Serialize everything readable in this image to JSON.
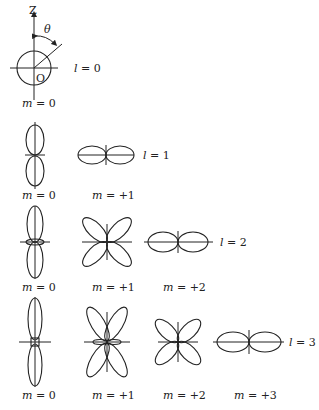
{
  "diagram": {
    "axis_label": "Z",
    "angle_label": "θ",
    "origin_label": "O",
    "rows": [
      {
        "l_label": "l = 0",
        "l_var": "l",
        "l_eq": " = 0",
        "items": [
          {
            "m_var": "m",
            "m_eq": " = 0"
          }
        ]
      },
      {
        "l_label": "l = 1",
        "l_var": "l",
        "l_eq": " = 1",
        "items": [
          {
            "m_var": "m",
            "m_eq": " = 0"
          },
          {
            "m_var": "m",
            "m_eq": " = +1"
          }
        ]
      },
      {
        "l_label": "l = 2",
        "l_var": "l",
        "l_eq": " = 2",
        "items": [
          {
            "m_var": "m",
            "m_eq": " = 0"
          },
          {
            "m_var": "m",
            "m_eq": " = +1"
          },
          {
            "m_var": "m",
            "m_eq": " = +2"
          }
        ]
      },
      {
        "l_label": "l = 3",
        "l_var": "l",
        "l_eq": " = 3",
        "items": [
          {
            "m_var": "m",
            "m_eq": " = 0"
          },
          {
            "m_var": "m",
            "m_eq": " = +1"
          },
          {
            "m_var": "m",
            "m_eq": " = +2"
          },
          {
            "m_var": "m",
            "m_eq": " = +3"
          }
        ]
      }
    ]
  }
}
